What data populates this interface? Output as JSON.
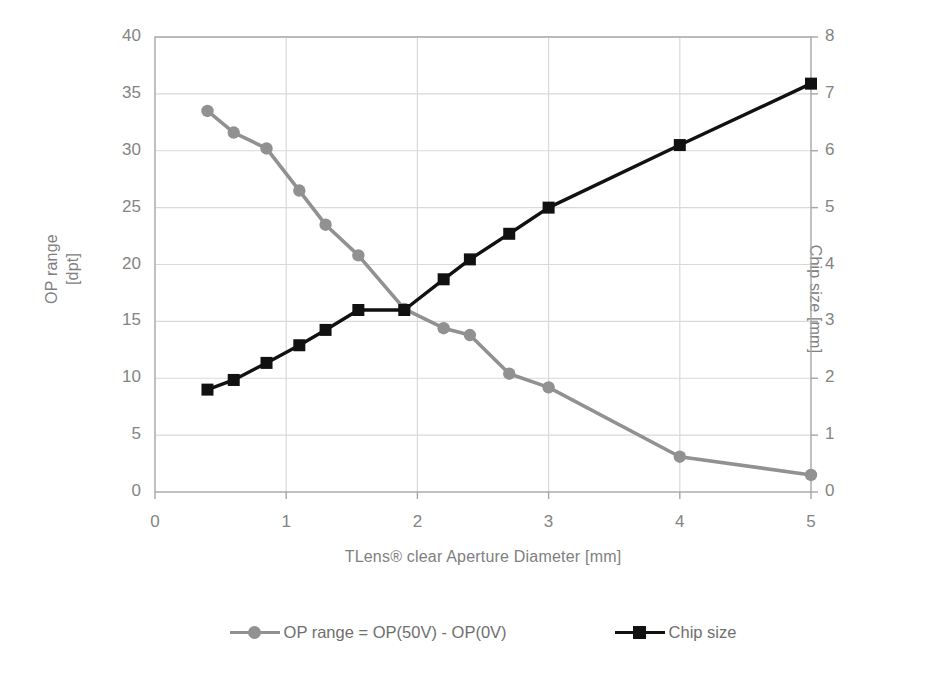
{
  "chart_data": {
    "type": "line",
    "title": "",
    "xlabel": "TLens® clear Aperture Diameter [mm]",
    "ylabel": "OP range [dpt]",
    "ylabel_line1": "OP range",
    "ylabel_line2": "[dpt]",
    "y2label": "Chip size [mm]",
    "xlim": [
      0,
      5
    ],
    "ylim": [
      0,
      40
    ],
    "y2lim": [
      0,
      8
    ],
    "xticks": [
      "0",
      "1",
      "2",
      "3",
      "4",
      "5"
    ],
    "xtick_values": [
      0,
      1,
      2,
      3,
      4,
      5
    ],
    "yticks": [
      "0",
      "5",
      "10",
      "15",
      "20",
      "25",
      "30",
      "35",
      "40"
    ],
    "ytick_values": [
      0,
      5,
      10,
      15,
      20,
      25,
      30,
      35,
      40
    ],
    "y2ticks": [
      "0",
      "1",
      "2",
      "3",
      "4",
      "5",
      "6",
      "7",
      "8"
    ],
    "y2tick_values": [
      0,
      1,
      2,
      3,
      4,
      5,
      6,
      7,
      8
    ],
    "grid": true,
    "legend_position": "bottom",
    "series": [
      {
        "name": "OP range = OP(50V) - OP(0V)",
        "axis": "left",
        "color": "#919191",
        "marker": "circle",
        "x": [
          0.4,
          0.6,
          0.85,
          1.1,
          1.3,
          1.55,
          1.9,
          2.2,
          2.4,
          2.7,
          3.0,
          4.0,
          5.0
        ],
        "values": [
          33.5,
          31.6,
          30.2,
          26.5,
          23.5,
          20.8,
          16.1,
          14.4,
          13.8,
          10.4,
          9.2,
          3.1,
          1.5
        ]
      },
      {
        "name": "Chip size",
        "axis": "right",
        "color": "#111111",
        "marker": "square",
        "x": [
          0.4,
          0.6,
          0.85,
          1.1,
          1.3,
          1.55,
          1.9,
          2.2,
          2.4,
          2.7,
          3.0,
          4.0,
          5.0
        ],
        "values": [
          1.8,
          1.97,
          2.27,
          2.58,
          2.85,
          3.2,
          3.2,
          3.74,
          4.09,
          4.54,
          5.0,
          6.1,
          7.18
        ]
      }
    ]
  },
  "legend": [
    {
      "label": "OP range = OP(50V) - OP(0V)",
      "color": "#919191",
      "marker": "circle"
    },
    {
      "label": "Chip size",
      "color": "#111111",
      "marker": "square"
    }
  ],
  "colors": {
    "op_range": "#919191",
    "chip_size": "#111111",
    "grid": "#d9d9d9",
    "axis": "#a6a6a6",
    "text": "#808080"
  }
}
